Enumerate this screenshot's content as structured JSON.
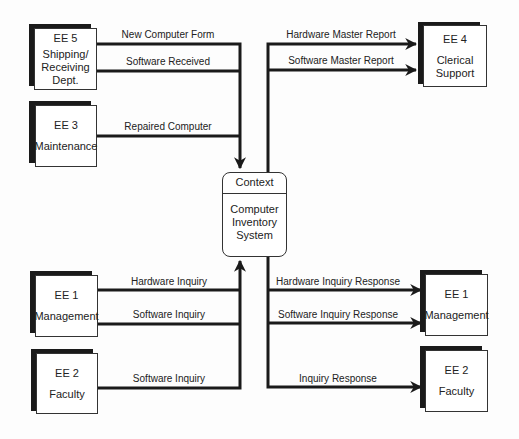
{
  "diagram": {
    "type": "context-level data flow diagram",
    "process": {
      "header": "Context",
      "name": "Computer Inventory System"
    },
    "external_entities": [
      {
        "key": "ee5",
        "id": "EE 5",
        "name": "Shipping/ Receiving Dept.",
        "lines": [
          "Shipping/",
          "Receiving",
          "Dept."
        ]
      },
      {
        "key": "ee3",
        "id": "EE 3",
        "name": "Maintenance",
        "lines": [
          "Maintenance"
        ]
      },
      {
        "key": "ee4",
        "id": "EE 4",
        "name": "Clerical Support",
        "lines": [
          "Clerical",
          "Support"
        ]
      },
      {
        "key": "ee1_left",
        "id": "EE 1",
        "name": "Management",
        "lines": [
          "Management"
        ]
      },
      {
        "key": "ee2_left",
        "id": "EE 2",
        "name": "Faculty",
        "lines": [
          "Faculty"
        ]
      },
      {
        "key": "ee1_right",
        "id": "EE 1",
        "name": "Management",
        "lines": [
          "Management"
        ]
      },
      {
        "key": "ee2_right",
        "id": "EE 2",
        "name": "Faculty",
        "lines": [
          "Faculty"
        ]
      }
    ],
    "flows": [
      {
        "label": "New Computer Form",
        "from": "EE 5",
        "to": "Computer Inventory System"
      },
      {
        "label": "Software Received",
        "from": "EE 5",
        "to": "Computer Inventory System"
      },
      {
        "label": "Repaired Computer",
        "from": "EE 3",
        "to": "Computer Inventory System"
      },
      {
        "label": "Hardware Master Report",
        "from": "Computer Inventory System",
        "to": "EE 4"
      },
      {
        "label": "Software Master Report",
        "from": "Computer Inventory System",
        "to": "EE 4"
      },
      {
        "label": "Hardware Inquiry",
        "from": "EE 1",
        "to": "Computer Inventory System"
      },
      {
        "label": "Software Inquiry",
        "from": "EE 1",
        "to": "Computer Inventory System"
      },
      {
        "label": "Software Inquiry",
        "from": "EE 2",
        "to": "Computer Inventory System"
      },
      {
        "label": "Hardware Inquiry Response",
        "from": "Computer Inventory System",
        "to": "EE 1"
      },
      {
        "label": "Software Inquiry Response",
        "from": "Computer Inventory System",
        "to": "EE 1"
      },
      {
        "label": "Inquiry Response",
        "from": "Computer Inventory System",
        "to": "EE 2"
      }
    ]
  },
  "colors": {
    "line": "#1a1a1a",
    "shadow": "#1a1a1a",
    "box_fill": "#ffffff"
  }
}
